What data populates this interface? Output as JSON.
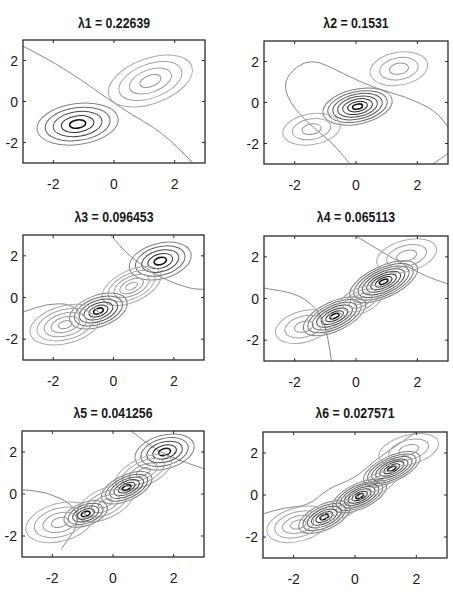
{
  "figure": {
    "layout": "3x2 grid of contour plots",
    "line_color": "#444444"
  },
  "chart_data": [
    {
      "type": "contour",
      "title": "λ1 = 0.22639",
      "xlim": [
        -3,
        3
      ],
      "ylim": [
        -3,
        3
      ],
      "xticks": [
        -2,
        0,
        2
      ],
      "yticks": [
        -2,
        0,
        2
      ],
      "xticklabels": [
        "-2",
        "0",
        "2"
      ],
      "yticklabels": [
        "2",
        "0",
        "-2"
      ],
      "grid": false,
      "lobes": [
        {
          "cx": -1.2,
          "cy": -1.1,
          "rx": 1.35,
          "ry": 1.0,
          "angle": 8,
          "levels": 5,
          "sign": "neg"
        },
        {
          "cx": 1.2,
          "cy": 1.0,
          "rx": 1.45,
          "ry": 1.1,
          "angle": 20,
          "levels": 4,
          "sign": "pos"
        }
      ],
      "zero_lines": [
        [
          [
            -3.0,
            2.7
          ],
          [
            -1.6,
            1.6
          ],
          [
            0.3,
            -0.4
          ],
          [
            1.6,
            -1.5
          ],
          [
            2.6,
            -3.0
          ]
        ]
      ]
    },
    {
      "type": "contour",
      "title": "λ2 = 0.1531",
      "xlim": [
        -3,
        3
      ],
      "ylim": [
        -3,
        3
      ],
      "xticks": [
        -2,
        0,
        2
      ],
      "yticks": [
        -2,
        0,
        2
      ],
      "xticklabels": [
        "-2",
        "0",
        "2"
      ],
      "yticklabels": [
        "2",
        "0",
        "-2"
      ],
      "grid": false,
      "lobes": [
        {
          "cx": 0.05,
          "cy": -0.2,
          "rx": 1.15,
          "ry": 0.85,
          "angle": 12,
          "levels": 7,
          "sign": "neg"
        },
        {
          "cx": 1.4,
          "cy": 1.65,
          "rx": 0.95,
          "ry": 0.8,
          "angle": 10,
          "levels": 3,
          "sign": "pos"
        },
        {
          "cx": -1.45,
          "cy": -1.3,
          "rx": 0.95,
          "ry": 0.75,
          "angle": 10,
          "levels": 3,
          "sign": "pos"
        }
      ],
      "zero_lines": [
        [
          [
            -0.2,
            -3.0
          ],
          [
            -0.8,
            -1.9
          ],
          [
            -1.6,
            -1.0
          ],
          [
            -2.3,
            0.3
          ],
          [
            -2.3,
            1.3
          ],
          [
            -1.5,
            2.2
          ],
          [
            -0.4,
            1.4
          ],
          [
            0.6,
            0.7
          ],
          [
            1.6,
            0.3
          ],
          [
            2.6,
            -0.4
          ],
          [
            3.0,
            -1.2
          ]
        ],
        [
          [
            3.0,
            -2.5
          ],
          [
            2.5,
            -3.0
          ]
        ]
      ]
    },
    {
      "type": "contour",
      "title": "λ3 = 0.096453",
      "xlim": [
        -3,
        3
      ],
      "ylim": [
        -3,
        3
      ],
      "xticks": [
        -2,
        0,
        2
      ],
      "yticks": [
        -2,
        0,
        2
      ],
      "xticklabels": [
        "-2",
        "0",
        "2"
      ],
      "yticklabels": [
        "2",
        "0",
        "-2"
      ],
      "grid": false,
      "lobes": [
        {
          "cx": 1.55,
          "cy": 1.75,
          "rx": 1.05,
          "ry": 0.85,
          "angle": 15,
          "levels": 5,
          "sign": "neg"
        },
        {
          "cx": 0.6,
          "cy": 0.55,
          "rx": 1.05,
          "ry": 0.75,
          "angle": 25,
          "levels": 5,
          "sign": "pos"
        },
        {
          "cx": -0.5,
          "cy": -0.65,
          "rx": 1.0,
          "ry": 0.75,
          "angle": 20,
          "levels": 6,
          "sign": "neg"
        },
        {
          "cx": -1.6,
          "cy": -1.3,
          "rx": 1.2,
          "ry": 0.9,
          "angle": 15,
          "levels": 5,
          "sign": "pos"
        }
      ],
      "zero_lines": [
        [
          [
            -0.1,
            3.0
          ],
          [
            0.5,
            2.0
          ],
          [
            1.6,
            0.9
          ],
          [
            2.6,
            0.4
          ],
          [
            3.0,
            0.4
          ]
        ],
        [
          [
            -3.0,
            -0.7
          ],
          [
            -2.2,
            -0.3
          ],
          [
            -1.4,
            -0.3
          ],
          [
            -1.0,
            -0.9
          ]
        ]
      ]
    },
    {
      "type": "contour",
      "title": "λ4 = 0.065113",
      "xlim": [
        -3,
        3
      ],
      "ylim": [
        -3,
        3
      ],
      "xticks": [
        -2,
        0,
        2
      ],
      "yticks": [
        -2,
        0,
        2
      ],
      "xticklabels": [
        "-2",
        "0",
        "2"
      ],
      "yticklabels": [
        "2",
        "0",
        "-2"
      ],
      "grid": false,
      "lobes": [
        {
          "cx": 0.9,
          "cy": 0.8,
          "rx": 1.2,
          "ry": 0.75,
          "angle": 25,
          "levels": 8,
          "sign": "neg"
        },
        {
          "cx": -0.7,
          "cy": -0.85,
          "rx": 1.1,
          "ry": 0.7,
          "angle": 25,
          "levels": 7,
          "sign": "neg"
        },
        {
          "cx": 0.15,
          "cy": -0.1,
          "rx": 0.8,
          "ry": 0.6,
          "angle": 25,
          "levels": 4,
          "sign": "pos"
        },
        {
          "cx": 1.65,
          "cy": 2.05,
          "rx": 1.0,
          "ry": 0.75,
          "angle": 15,
          "levels": 3,
          "sign": "pos"
        },
        {
          "cx": -1.7,
          "cy": -1.35,
          "rx": 0.95,
          "ry": 0.75,
          "angle": 15,
          "levels": 3,
          "sign": "pos"
        }
      ],
      "zero_lines": [
        [
          [
            0.0,
            3.0
          ],
          [
            1.0,
            2.1
          ],
          [
            2.2,
            1.1
          ],
          [
            3.0,
            0.7
          ]
        ],
        [
          [
            -3.0,
            0.5
          ],
          [
            -1.8,
            0.2
          ],
          [
            -1.1,
            -0.8
          ],
          [
            -0.9,
            -2.0
          ],
          [
            -0.8,
            -3.0
          ]
        ]
      ]
    },
    {
      "type": "contour",
      "title": "λ5 = 0.041256",
      "xlim": [
        -3,
        3
      ],
      "ylim": [
        -3,
        3
      ],
      "xticks": [
        -2,
        0,
        2
      ],
      "yticks": [
        -2,
        0,
        2
      ],
      "xticklabels": [
        "-2",
        "0",
        "2"
      ],
      "yticklabels": [
        "2",
        "0",
        "-2"
      ],
      "grid": false,
      "lobes": [
        {
          "cx": 1.7,
          "cy": 2.0,
          "rx": 1.0,
          "ry": 0.8,
          "angle": 15,
          "levels": 5,
          "sign": "neg"
        },
        {
          "cx": 1.0,
          "cy": 1.05,
          "rx": 1.0,
          "ry": 0.65,
          "angle": 25,
          "levels": 4,
          "sign": "pos"
        },
        {
          "cx": 0.45,
          "cy": 0.3,
          "rx": 0.9,
          "ry": 0.6,
          "angle": 25,
          "levels": 6,
          "sign": "neg"
        },
        {
          "cx": -0.25,
          "cy": -0.45,
          "rx": 1.0,
          "ry": 0.7,
          "angle": 25,
          "levels": 4,
          "sign": "pos"
        },
        {
          "cx": -0.9,
          "cy": -0.95,
          "rx": 0.75,
          "ry": 0.55,
          "angle": 20,
          "levels": 5,
          "sign": "neg"
        },
        {
          "cx": -1.75,
          "cy": -1.35,
          "rx": 1.15,
          "ry": 0.9,
          "angle": 15,
          "levels": 4,
          "sign": "pos"
        }
      ],
      "zero_lines": [
        [
          [
            0.6,
            3.0
          ],
          [
            1.5,
            2.0
          ],
          [
            2.4,
            1.5
          ],
          [
            3.0,
            1.2
          ]
        ],
        [
          [
            -3.0,
            0.2
          ],
          [
            -2.2,
            0.1
          ],
          [
            -1.3,
            -0.5
          ],
          [
            -1.1,
            -1.4
          ],
          [
            -1.7,
            -2.6
          ]
        ]
      ]
    },
    {
      "type": "contour",
      "title": "λ6 = 0.027571",
      "xlim": [
        -3,
        3
      ],
      "ylim": [
        -3,
        3
      ],
      "xticks": [
        -2,
        0,
        2
      ],
      "yticks": [
        -2,
        0,
        2
      ],
      "xticklabels": [
        "-2",
        "0",
        "2"
      ],
      "yticklabels": [
        "2",
        "0",
        "-2"
      ],
      "grid": false,
      "lobes": [
        {
          "cx": 1.2,
          "cy": 1.25,
          "rx": 1.0,
          "ry": 0.6,
          "angle": 25,
          "levels": 7,
          "sign": "neg"
        },
        {
          "cx": 0.15,
          "cy": -0.05,
          "rx": 0.95,
          "ry": 0.6,
          "angle": 25,
          "levels": 7,
          "sign": "neg"
        },
        {
          "cx": -1.0,
          "cy": -1.05,
          "rx": 0.9,
          "ry": 0.6,
          "angle": 25,
          "levels": 6,
          "sign": "neg"
        },
        {
          "cx": 1.75,
          "cy": 2.15,
          "rx": 1.0,
          "ry": 0.7,
          "angle": 15,
          "levels": 3,
          "sign": "pos"
        },
        {
          "cx": 0.75,
          "cy": 0.55,
          "rx": 0.65,
          "ry": 0.45,
          "angle": 25,
          "levels": 3,
          "sign": "pos"
        },
        {
          "cx": -0.4,
          "cy": -0.6,
          "rx": 0.65,
          "ry": 0.45,
          "angle": 25,
          "levels": 3,
          "sign": "pos"
        },
        {
          "cx": -1.85,
          "cy": -1.4,
          "rx": 1.05,
          "ry": 0.8,
          "angle": 15,
          "levels": 4,
          "sign": "pos"
        }
      ],
      "zero_lines": [
        [
          [
            -3.0,
            -0.9
          ],
          [
            -2.3,
            -0.6
          ],
          [
            -1.5,
            -0.5
          ],
          [
            -0.9,
            0.3
          ],
          [
            0.0,
            0.8
          ],
          [
            0.6,
            1.6
          ],
          [
            1.4,
            2.4
          ],
          [
            2.0,
            3.0
          ]
        ]
      ]
    }
  ]
}
